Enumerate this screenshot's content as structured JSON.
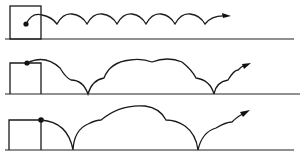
{
  "diagram": {
    "colors": {
      "stroke": "#1a1a1a",
      "background": "#ffffff"
    },
    "panels": [
      {
        "id": 1,
        "label": "",
        "launch_point": "inside-box",
        "trajectory": "small-regular-scallops",
        "ends_with": "arrow"
      },
      {
        "id": 2,
        "label": "",
        "launch_point": "box-top-left",
        "trajectory": "two-ground-contacts-with-large-hump",
        "ends_with": "arrow"
      },
      {
        "id": 3,
        "label": "",
        "launch_point": "box-top-right-corner",
        "trajectory": "one-large-hump-between-ground-contacts",
        "ends_with": "arrow"
      }
    ]
  }
}
